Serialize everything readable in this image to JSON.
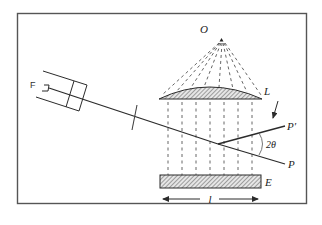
{
  "diagram": {
    "type": "optical-schematic",
    "labels": {
      "source_point": "O",
      "lens": "L",
      "screen": "E",
      "device": "F",
      "beam_out_upper": "P′",
      "beam_out_lower": "P",
      "angle": "2θ",
      "length": "l"
    },
    "colors": {
      "line": "#2b2b2b",
      "frame": "#555555",
      "hatch": "#6a6a6a",
      "background": "#ffffff"
    },
    "elements": [
      {
        "id": "frame",
        "kind": "rectangle border"
      },
      {
        "id": "point-source",
        "label": "O",
        "kind": "point with dashed ray fan"
      },
      {
        "id": "lens",
        "label": "L",
        "kind": "hatched plano-convex lens"
      },
      {
        "id": "screen",
        "label": "E",
        "kind": "hatched plate"
      },
      {
        "id": "device",
        "label": "F",
        "kind": "double-barrel apparatus"
      },
      {
        "id": "incident-beam",
        "kind": "solid line"
      },
      {
        "id": "beam-P",
        "label": "P",
        "kind": "solid line"
      },
      {
        "id": "beam-P-prime",
        "label": "P′",
        "kind": "solid line"
      },
      {
        "id": "angle-arc",
        "label": "2θ",
        "kind": "arc"
      },
      {
        "id": "length-arrow",
        "label": "l",
        "kind": "double-headed arrow"
      },
      {
        "id": "direction-arrow",
        "kind": "arrow pointing down-left"
      }
    ]
  }
}
